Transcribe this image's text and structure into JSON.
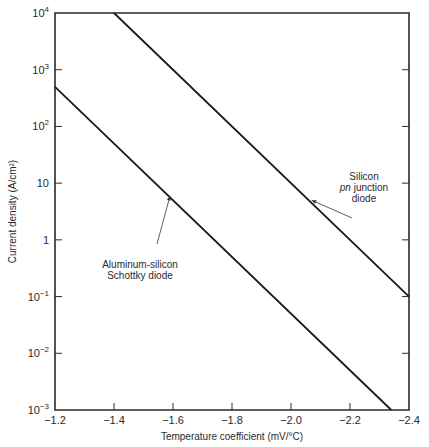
{
  "chart_data": {
    "type": "line",
    "title": "",
    "xlabel": "Temperature coefficient (mV/°C)",
    "ylabel": "Current density (A/cm²)",
    "xlim": [
      -1.2,
      -2.4
    ],
    "ylim": [
      0.001,
      10000
    ],
    "yscale": "log",
    "grid": false,
    "x_ticks": [
      -1.2,
      -1.4,
      -1.6,
      -1.8,
      -2.0,
      -2.2,
      -2.4
    ],
    "x_tick_labels": [
      "−1.2",
      "−1.4",
      "−1.6",
      "−1.8",
      "−2.0",
      "−2.2",
      "−2.4"
    ],
    "y_ticks": [
      0.001,
      0.01,
      0.1,
      1,
      10,
      100,
      1000,
      10000
    ],
    "y_tick_labels": [
      {
        "base": "10",
        "exp": "−3"
      },
      {
        "base": "10",
        "exp": "−2"
      },
      {
        "base": "10",
        "exp": "−1"
      },
      {
        "base": "1",
        "exp": ""
      },
      {
        "base": "10",
        "exp": ""
      },
      {
        "base": "10",
        "exp": "2"
      },
      {
        "base": "10",
        "exp": "3"
      },
      {
        "base": "10",
        "exp": "4"
      }
    ],
    "series": [
      {
        "name": "Silicon pn junction diode",
        "x": [
          -1.4,
          -2.4
        ],
        "y": [
          10000,
          0.1
        ]
      },
      {
        "name": "Aluminum-silicon Schottky diode",
        "x": [
          -1.2,
          -2.34
        ],
        "y": [
          500,
          0.001
        ]
      }
    ],
    "annotations": [
      {
        "series": 0,
        "lines": [
          {
            "text": "Silicon",
            "italic_prefix": ""
          },
          {
            "text": " junction",
            "italic_prefix": "pn"
          },
          {
            "text": "diode",
            "italic_prefix": ""
          }
        ],
        "arrow_to": {
          "x": -2.07,
          "y": 5
        }
      },
      {
        "series": 1,
        "lines": [
          {
            "text": "Aluminum-silicon",
            "italic_prefix": ""
          },
          {
            "text": "Schottky diode",
            "italic_prefix": ""
          }
        ],
        "arrow_to": {
          "x": -1.59,
          "y": 6
        }
      }
    ]
  }
}
